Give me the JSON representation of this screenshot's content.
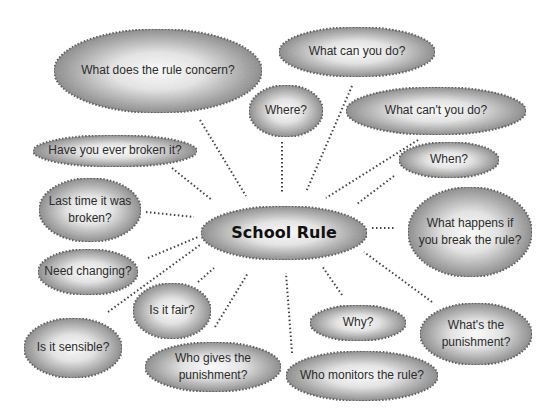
{
  "diagram": {
    "type": "mind-map",
    "center": {
      "id": "school-rule",
      "label": "School Rule"
    },
    "style": {
      "fill_light": "#ffffff",
      "fill_dark": "#8a8a8a",
      "border": "#555555",
      "connector": "#444444"
    },
    "nodes": [
      {
        "id": "what-does-the-rule-concern",
        "lines": [
          "What does the rule concern?"
        ]
      },
      {
        "id": "where",
        "lines": [
          "Where?"
        ]
      },
      {
        "id": "what-can-you-do",
        "lines": [
          "What can you do?"
        ]
      },
      {
        "id": "what-cant-you-do",
        "lines": [
          "What can't you do?"
        ]
      },
      {
        "id": "have-you-ever-broken-it",
        "lines": [
          "Have you ever broken it?"
        ]
      },
      {
        "id": "when",
        "lines": [
          "When?"
        ]
      },
      {
        "id": "last-time-it-was-broken",
        "lines": [
          "Last time it was",
          "broken?"
        ]
      },
      {
        "id": "what-happens-if-you-break-the-rule",
        "lines": [
          "What happens if",
          "you break the rule?"
        ]
      },
      {
        "id": "need-changing",
        "lines": [
          "Need changing?"
        ]
      },
      {
        "id": "is-it-fair",
        "lines": [
          "Is it fair?"
        ]
      },
      {
        "id": "is-it-sensible",
        "lines": [
          "Is it sensible?"
        ]
      },
      {
        "id": "why",
        "lines": [
          "Why?"
        ]
      },
      {
        "id": "whats-the-punishment",
        "lines": [
          "What's the",
          "punishment?"
        ]
      },
      {
        "id": "who-gives-the-punishment",
        "lines": [
          "Who gives the",
          "punishment?"
        ]
      },
      {
        "id": "who-monitors-the-rule",
        "lines": [
          "Who monitors the rule?"
        ]
      }
    ],
    "connections": [
      [
        "school-rule",
        "what-does-the-rule-concern"
      ],
      [
        "school-rule",
        "where"
      ],
      [
        "school-rule",
        "what-can-you-do"
      ],
      [
        "school-rule",
        "what-cant-you-do"
      ],
      [
        "school-rule",
        "have-you-ever-broken-it"
      ],
      [
        "school-rule",
        "when"
      ],
      [
        "school-rule",
        "last-time-it-was-broken"
      ],
      [
        "school-rule",
        "what-happens-if-you-break-the-rule"
      ],
      [
        "school-rule",
        "need-changing"
      ],
      [
        "school-rule",
        "is-it-fair"
      ],
      [
        "school-rule",
        "is-it-sensible"
      ],
      [
        "school-rule",
        "why"
      ],
      [
        "school-rule",
        "whats-the-punishment"
      ],
      [
        "school-rule",
        "who-gives-the-punishment"
      ],
      [
        "school-rule",
        "who-monitors-the-rule"
      ]
    ]
  }
}
